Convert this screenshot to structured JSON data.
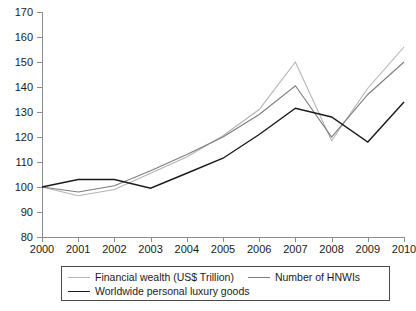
{
  "chart_data": {
    "type": "line",
    "title": "",
    "subtitle": "",
    "xlabel": "",
    "ylabel": "",
    "x": [
      2000,
      2001,
      2002,
      2003,
      2004,
      2005,
      2006,
      2007,
      2008,
      2009,
      2010
    ],
    "categories": [
      "2000",
      "2001",
      "2002",
      "2003",
      "2004",
      "2005",
      "2006",
      "2007",
      "2008",
      "2009",
      "2010"
    ],
    "xlim": [
      2000,
      2010
    ],
    "ylim": [
      80,
      170
    ],
    "yticks": [
      80,
      90,
      100,
      110,
      120,
      130,
      140,
      150,
      160,
      170
    ],
    "ytick_labels": [
      "80",
      "90",
      "100",
      "110",
      "120",
      "130",
      "140",
      "150",
      "160",
      "170"
    ],
    "grid": false,
    "legend_position": "below",
    "series": [
      {
        "name": "Financial wealth (US$ Trillion)",
        "color": "#b4b4b4",
        "width": 1.1,
        "values": [
          100,
          96.5,
          99,
          105.5,
          112,
          120.5,
          131,
          150,
          118.5,
          139.5,
          156
        ]
      },
      {
        "name": "Number of HNWIs",
        "color": "#7d7d7d",
        "width": 1.1,
        "values": [
          100,
          98,
          100.5,
          106.5,
          113,
          120,
          129,
          140.5,
          120,
          137,
          150
        ]
      },
      {
        "name": "Worldwide personal luxury goods",
        "color": "#1a1a1a",
        "width": 1.4,
        "values": [
          100,
          103,
          103,
          99.5,
          105.5,
          111.5,
          121,
          131.5,
          128,
          118,
          134
        ]
      }
    ]
  },
  "legend": {
    "rows": [
      [
        {
          "label": "Financial wealth (US$ Trillion)",
          "color": "#b4b4b4",
          "width": 1.1
        },
        {
          "label": "Number of HNWIs",
          "color": "#7d7d7d",
          "width": 1.1
        }
      ],
      [
        {
          "label": "Worldwide personal luxury goods",
          "color": "#1a1a1a",
          "width": 1.4
        }
      ]
    ]
  }
}
